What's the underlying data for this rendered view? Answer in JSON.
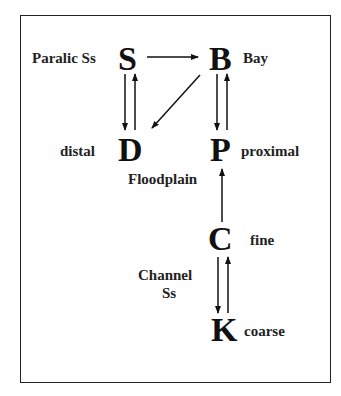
{
  "diagram": {
    "nodes": {
      "S": {
        "letter": "S",
        "label": "Paralic Ss"
      },
      "B": {
        "letter": "B",
        "label": "Bay"
      },
      "D": {
        "letter": "D",
        "label": "distal"
      },
      "P": {
        "letter": "P",
        "label": "proximal"
      },
      "C": {
        "letter": "C",
        "label": "fine"
      },
      "K": {
        "letter": "K",
        "label": "coarse"
      }
    },
    "group_labels": {
      "floodplain": "Floodplain",
      "channel_line1": "Channel",
      "channel_line2": "Ss"
    },
    "edges": [
      {
        "from": "S",
        "to": "B"
      },
      {
        "from": "S",
        "to": "D"
      },
      {
        "from": "D",
        "to": "S"
      },
      {
        "from": "B",
        "to": "D"
      },
      {
        "from": "B",
        "to": "P"
      },
      {
        "from": "P",
        "to": "B"
      },
      {
        "from": "C",
        "to": "P"
      },
      {
        "from": "C",
        "to": "K"
      },
      {
        "from": "K",
        "to": "C"
      }
    ]
  }
}
